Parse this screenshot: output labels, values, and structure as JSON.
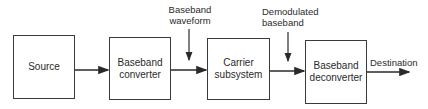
{
  "blocks": [
    {
      "id": "source",
      "label": "Source"
    },
    {
      "id": "baseband-converter",
      "label_line1": "Baseband",
      "label_line2": "converter"
    },
    {
      "id": "carrier-subsystem",
      "label_line1": "Carrier",
      "label_line2": "subsystem"
    },
    {
      "id": "baseband-deconverter",
      "label_line1": "Baseband",
      "label_line2": "deconverter"
    }
  ],
  "annotations": {
    "baseband_waveform": {
      "line1": "Baseband",
      "line2": "waveform"
    },
    "demodulated_baseband": {
      "line1": "Demodulated",
      "line2": "baseband"
    }
  },
  "output_label": "Destination"
}
